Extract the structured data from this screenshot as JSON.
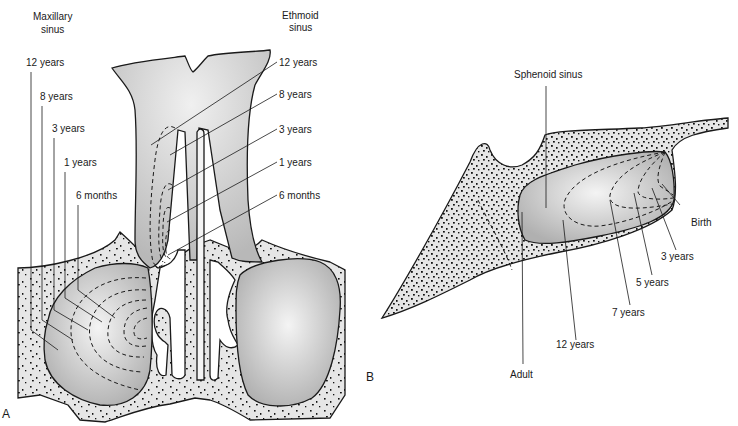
{
  "figure": {
    "panels": [
      {
        "id": "A",
        "label": "A",
        "view": "coronal",
        "structures": {
          "maxillary_title_line1": "Maxillary",
          "maxillary_title_line2": "sinus",
          "ethmoid_title_line1": "Ethmoid",
          "ethmoid_title_line2": "sinus"
        },
        "maxillary_stages": [
          "12 years",
          "8 years",
          "3 years",
          "1 years",
          "6 months"
        ],
        "ethmoid_stages": [
          "12 years",
          "8 years",
          "3 years",
          "1 years",
          "6 months"
        ]
      },
      {
        "id": "B",
        "label": "B",
        "view": "sagittal",
        "structures": {
          "sphenoid_title": "Sphenoid sinus"
        },
        "sphenoid_stages": [
          "Birth",
          "3 years",
          "5 years",
          "7 years",
          "12 years",
          "Adult"
        ]
      }
    ]
  },
  "colors": {
    "line": "#1a1a1a",
    "bone": "#e6e6e6",
    "sinus_light": "#f2f2f2",
    "sinus_dark": "#b4b4b4"
  }
}
